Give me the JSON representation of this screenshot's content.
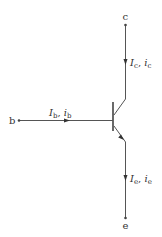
{
  "diagram": {
    "type": "npn-transistor",
    "colors": {
      "stroke": "#555555",
      "text": "#333333",
      "background": "#ffffff"
    },
    "terminals": {
      "collector": {
        "label": "c"
      },
      "base": {
        "label": "b"
      },
      "emitter": {
        "label": "e"
      }
    },
    "currents": {
      "collector": {
        "dc": "I",
        "dc_sub": "c",
        "sep": ", ",
        "ac": "i",
        "ac_sub": "c",
        "direction": "down"
      },
      "base": {
        "dc": "I",
        "dc_sub": "b",
        "sep": ", ",
        "ac": "i",
        "ac_sub": "b",
        "direction": "right"
      },
      "emitter": {
        "dc": "I",
        "dc_sub": "e",
        "sep": ", ",
        "ac": "i",
        "ac_sub": "e",
        "direction": "down"
      }
    }
  }
}
